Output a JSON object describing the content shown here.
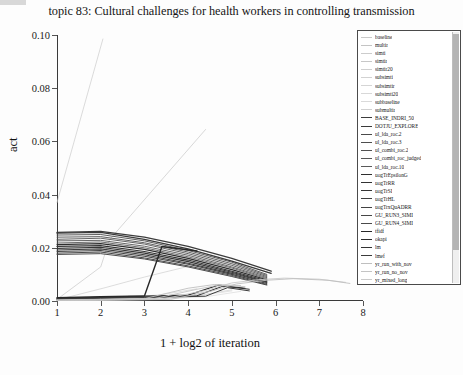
{
  "chart_data": {
    "type": "line",
    "title": "topic 83: Cultural challenges for health workers in controlling transmission",
    "xlabel": "1 + log2 of iteration",
    "ylabel": "act",
    "xlim": [
      1,
      8
    ],
    "ylim": [
      0.0,
      0.1
    ],
    "xticks": [
      "1",
      "2",
      "3",
      "4",
      "5",
      "6",
      "7",
      "8"
    ],
    "yticks": [
      "0.00",
      "0.02",
      "0.04",
      "0.06",
      "0.08",
      "0.10"
    ],
    "grid": false,
    "legend_position": "right",
    "series": [
      {
        "name": "baseline",
        "color": "#c9c9c9",
        "width": 0.7,
        "points": [
          [
            1,
            0.0005
          ],
          [
            2,
            0.0008
          ],
          [
            2.6,
            0.001
          ]
        ]
      },
      {
        "name": "multir",
        "color": "#c4c4c4",
        "width": 0.7,
        "points": [
          [
            1,
            0.0004
          ],
          [
            1.8,
            0.0009
          ],
          [
            2.2,
            0.0012
          ]
        ]
      },
      {
        "name": "simti",
        "color": "#cccccc",
        "width": 0.7,
        "points": [
          [
            1,
            0.037
          ],
          [
            2.05,
            0.0985
          ]
        ]
      },
      {
        "name": "simtir",
        "color": "#c7c7c7",
        "width": 0.7,
        "points": [
          [
            1,
            0.0006
          ],
          [
            2.0,
            0.0128
          ],
          [
            2.2,
            0.023
          ],
          [
            4.4,
            0.0645
          ]
        ]
      },
      {
        "name": "simtir20",
        "color": "#cfcfcf",
        "width": 0.7,
        "points": [
          [
            1,
            0.0004
          ],
          [
            2.1,
            0.005
          ],
          [
            3.0,
            0.009
          ],
          [
            4.0,
            0.013
          ]
        ]
      },
      {
        "name": "subsimti",
        "color": "#d2d2d2",
        "width": 0.7,
        "points": [
          [
            1,
            0.0003
          ],
          [
            2.4,
            0.001
          ],
          [
            3.4,
            0.0024
          ],
          [
            4.2,
            0.0046
          ]
        ]
      },
      {
        "name": "subsimtir",
        "color": "#d5d5d5",
        "width": 0.7,
        "points": [
          [
            1,
            0.0002
          ],
          [
            2.8,
            0.0006
          ],
          [
            3.8,
            0.0018
          ],
          [
            4.6,
            0.004
          ]
        ]
      },
      {
        "name": "subsimti20",
        "color": "#d8d8d8",
        "width": 0.7,
        "points": [
          [
            1,
            0.0002
          ],
          [
            3.0,
            0.0005
          ],
          [
            4.0,
            0.0014
          ],
          [
            5.0,
            0.0038
          ]
        ]
      },
      {
        "name": "subbaseline",
        "color": "#dadada",
        "width": 0.7,
        "points": [
          [
            1,
            0.0002
          ],
          [
            3.2,
            0.0006
          ],
          [
            4.4,
            0.0016
          ],
          [
            5.2,
            0.0036
          ]
        ]
      },
      {
        "name": "submultir",
        "color": "#d0d0d0",
        "width": 0.7,
        "points": [
          [
            1,
            0.0003
          ],
          [
            3.0,
            0.0008
          ],
          [
            4.2,
            0.002
          ],
          [
            5.0,
            0.0042
          ]
        ]
      },
      {
        "name": "BASE_INDRI_50",
        "color": "#3c3c3c",
        "width": 1.3,
        "points": [
          [
            1,
            0.0258
          ],
          [
            2,
            0.0262
          ],
          [
            3,
            0.024
          ],
          [
            4,
            0.0205
          ],
          [
            5,
            0.016
          ],
          [
            5.9,
            0.0112
          ]
        ]
      },
      {
        "name": "DOTJU_EXPLORE",
        "color": "#3a3a3a",
        "width": 1.3,
        "points": [
          [
            1,
            0.0255
          ],
          [
            2,
            0.0258
          ],
          [
            3,
            0.0232
          ],
          [
            4,
            0.0196
          ],
          [
            5,
            0.015
          ],
          [
            5.9,
            0.0104
          ]
        ]
      },
      {
        "name": "ul_lda_roc.2",
        "color": "#4a4a4a",
        "width": 0.9,
        "points": [
          [
            1,
            0.0248
          ],
          [
            2,
            0.025
          ],
          [
            3,
            0.0226
          ],
          [
            4,
            0.019
          ],
          [
            5,
            0.0146
          ],
          [
            5.8,
            0.01
          ]
        ]
      },
      {
        "name": "ul_lda_roc.3",
        "color": "#4e4e4e",
        "width": 0.9,
        "points": [
          [
            1,
            0.024
          ],
          [
            2,
            0.0242
          ],
          [
            3,
            0.0219
          ],
          [
            4,
            0.0184
          ],
          [
            5,
            0.014
          ],
          [
            5.8,
            0.0096
          ]
        ]
      },
      {
        "name": "ul_combi_roc.2",
        "color": "#525252",
        "width": 0.9,
        "points": [
          [
            1,
            0.0232
          ],
          [
            2,
            0.0236
          ],
          [
            3,
            0.0214
          ],
          [
            4,
            0.0178
          ],
          [
            5,
            0.0134
          ],
          [
            5.8,
            0.0092
          ]
        ]
      },
      {
        "name": "ul_combi_roc_judged",
        "color": "#565656",
        "width": 0.9,
        "points": [
          [
            1,
            0.0226
          ],
          [
            2,
            0.0228
          ],
          [
            3,
            0.0206
          ],
          [
            4,
            0.0172
          ],
          [
            5,
            0.0128
          ],
          [
            5.8,
            0.0088
          ]
        ]
      },
      {
        "name": "ul_lda_roc.10",
        "color": "#5a5a5a",
        "width": 0.9,
        "points": [
          [
            1,
            0.0218
          ],
          [
            2,
            0.0222
          ],
          [
            3,
            0.02
          ],
          [
            4,
            0.0166
          ],
          [
            5,
            0.0124
          ],
          [
            5.8,
            0.0084
          ]
        ]
      },
      {
        "name": "uogTrEpsilonG",
        "color": "#2e2e2e",
        "width": 1.2,
        "points": [
          [
            1,
            0.0212
          ],
          [
            2,
            0.0216
          ],
          [
            3,
            0.0194
          ],
          [
            4,
            0.016
          ],
          [
            5,
            0.0118
          ],
          [
            5.8,
            0.008
          ]
        ]
      },
      {
        "name": "uogTrRR",
        "color": "#323232",
        "width": 1.2,
        "points": [
          [
            1,
            0.0205
          ],
          [
            2,
            0.0208
          ],
          [
            3,
            0.0186
          ],
          [
            4,
            0.0154
          ],
          [
            5,
            0.0112
          ],
          [
            5.8,
            0.0076
          ]
        ]
      },
      {
        "name": "uogTrSI",
        "color": "#363636",
        "width": 1.1,
        "points": [
          [
            1,
            0.0198
          ],
          [
            2,
            0.0202
          ],
          [
            3,
            0.018
          ],
          [
            4,
            0.0148
          ],
          [
            5,
            0.0108
          ],
          [
            5.8,
            0.0072
          ]
        ]
      },
      {
        "name": "uogTrHL",
        "color": "#3e3e3e",
        "width": 1.1,
        "points": [
          [
            1,
            0.0192
          ],
          [
            2,
            0.0196
          ],
          [
            3,
            0.0174
          ],
          [
            4,
            0.0142
          ],
          [
            5,
            0.0104
          ],
          [
            5.8,
            0.007
          ]
        ]
      },
      {
        "name": "uogTrxQuADRR",
        "color": "#424242",
        "width": 1.1,
        "points": [
          [
            1,
            0.0186
          ],
          [
            2,
            0.019
          ],
          [
            3,
            0.0168
          ],
          [
            4,
            0.0138
          ],
          [
            5,
            0.01
          ],
          [
            5.8,
            0.0066
          ]
        ]
      },
      {
        "name": "GU_RUN3_SIMI",
        "color": "#464646",
        "width": 1.0,
        "points": [
          [
            1,
            0.018
          ],
          [
            2,
            0.0184
          ],
          [
            3,
            0.0162
          ],
          [
            4,
            0.0132
          ],
          [
            5,
            0.0096
          ],
          [
            5.8,
            0.0062
          ]
        ]
      },
      {
        "name": "GU_RUN4_SIMI",
        "color": "#4a4a4a",
        "width": 1.0,
        "points": [
          [
            1,
            0.0175
          ],
          [
            2,
            0.0178
          ],
          [
            3,
            0.0158
          ],
          [
            4,
            0.0128
          ],
          [
            5,
            0.0092
          ],
          [
            5.8,
            0.006
          ]
        ]
      },
      {
        "name": "tfidf",
        "color": "#282828",
        "width": 1.4,
        "points": [
          [
            1,
            0.0012
          ],
          [
            2,
            0.0016
          ],
          [
            3,
            0.0019
          ],
          [
            3.4,
            0.0205
          ],
          [
            4.2,
            0.0188
          ]
        ]
      },
      {
        "name": "okapi",
        "color": "#2c2c2c",
        "width": 1.2,
        "points": [
          [
            1,
            0.001
          ],
          [
            2,
            0.0014
          ],
          [
            3,
            0.0018
          ],
          [
            4.0,
            0.0022
          ],
          [
            4.7,
            0.006
          ],
          [
            5.3,
            0.0048
          ]
        ]
      },
      {
        "name": "lm",
        "color": "#333333",
        "width": 1.1,
        "points": [
          [
            1,
            0.0008
          ],
          [
            2,
            0.0012
          ],
          [
            3,
            0.0015
          ],
          [
            4.2,
            0.002
          ],
          [
            4.8,
            0.0056
          ],
          [
            5.4,
            0.0044
          ]
        ]
      },
      {
        "name": "lmef",
        "color": "#3b3b3b",
        "width": 1.0,
        "points": [
          [
            1,
            0.0006
          ],
          [
            2,
            0.001
          ],
          [
            3,
            0.0013
          ],
          [
            4.4,
            0.0018
          ],
          [
            4.9,
            0.005
          ],
          [
            5.4,
            0.0038
          ]
        ]
      },
      {
        "name": "yr_run_with_nov",
        "color": "#bfbfbf",
        "width": 0.9,
        "points": [
          [
            1,
            0.0004
          ],
          [
            3.0,
            0.0009
          ],
          [
            4.0,
            0.0048
          ],
          [
            4.6,
            0.0062
          ],
          [
            5.2,
            0.0058
          ]
        ]
      },
      {
        "name": "yr_run_no_nov",
        "color": "#c4c4c4",
        "width": 0.9,
        "points": [
          [
            1,
            0.0003
          ],
          [
            3.2,
            0.0008
          ],
          [
            4.2,
            0.0044
          ],
          [
            4.7,
            0.006
          ],
          [
            5.3,
            0.0054
          ]
        ]
      },
      {
        "name": "yr_mixed_long",
        "color": "#cacaca",
        "width": 0.9,
        "points": [
          [
            1,
            0.0003
          ],
          [
            3.4,
            0.0007
          ],
          [
            4.4,
            0.004
          ],
          [
            5.0,
            0.0068
          ],
          [
            5.6,
            0.008
          ],
          [
            6.2,
            0.0086
          ],
          [
            7.0,
            0.0082
          ],
          [
            7.6,
            0.007
          ]
        ]
      },
      {
        "name": "yr_mixed_sim_nov",
        "color": "#c0c0c0",
        "width": 0.9,
        "points": [
          [
            1,
            0.0002
          ],
          [
            3.6,
            0.0006
          ],
          [
            4.5,
            0.0036
          ],
          [
            5.1,
            0.0064
          ],
          [
            5.8,
            0.0078
          ],
          [
            6.4,
            0.0084
          ],
          [
            7.2,
            0.0078
          ],
          [
            7.7,
            0.0066
          ]
        ]
      }
    ]
  }
}
